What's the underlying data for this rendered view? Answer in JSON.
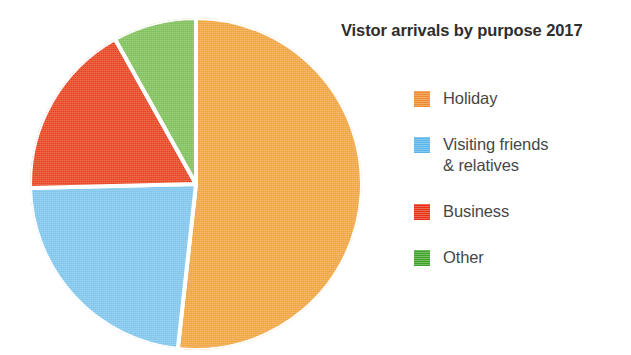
{
  "chart_data": {
    "type": "pie",
    "title": "Vistor arrivals by purpose 2017",
    "subtitle": "",
    "xlabel": "",
    "ylabel": "",
    "grid": false,
    "legend_position": "right",
    "start_angle_deg": 0,
    "direction": "clockwise",
    "categories": [
      "Holiday",
      "Visiting friends & relatives",
      "Business",
      "Other"
    ],
    "values": [
      51.8,
      22.9,
      17.3,
      8.1
    ],
    "value_unit": "percent",
    "slices": [
      {
        "label": "Holiday",
        "value": 51.8,
        "color": "#F0A33C",
        "start_deg": 0.0,
        "end_deg": 186.3
      },
      {
        "label": "Visiting friends & relatives",
        "value": 22.9,
        "color": "#7CC4EC",
        "start_deg": 186.3,
        "end_deg": 268.6
      },
      {
        "label": "Business",
        "value": 17.3,
        "color": "#E8401C",
        "start_deg": 268.6,
        "end_deg": 330.8
      },
      {
        "label": "Other",
        "value": 8.1,
        "color": "#7DBF56",
        "start_deg": 330.8,
        "end_deg": 360.0
      }
    ],
    "annotations": []
  },
  "title": {
    "text": "Vistor arrivals by purpose 2017"
  },
  "legend": {
    "items": [
      {
        "label": "Holiday",
        "line1": "Holiday",
        "line2": "",
        "color": "#ED8B2E"
      },
      {
        "label": "Visiting friends & relatives",
        "line1": "Visiting friends",
        "line2": "& relatives",
        "color": "#5BB3E8"
      },
      {
        "label": "Business",
        "line1": "Business",
        "line2": "",
        "color": "#E53015"
      },
      {
        "label": "Other",
        "line1": "Other",
        "line2": "",
        "color": "#3FA32B"
      }
    ]
  },
  "colors": {
    "holiday": "#F0A33C",
    "visiting_friends": "#7CC4EC",
    "business": "#E8401C",
    "other": "#7DBF56",
    "title_text": "#2e2e2e",
    "legend_text": "#474747",
    "background": "#ffffff",
    "slice_divider": "#ffffff"
  }
}
